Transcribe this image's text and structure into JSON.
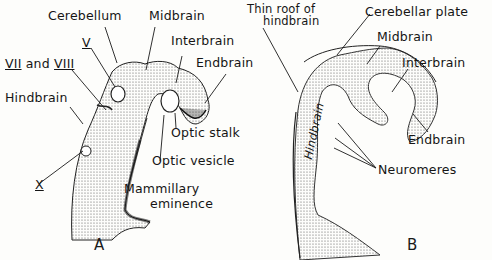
{
  "figure_a": {
    "panel_label": "A",
    "labels": {
      "cerebellum": "Cerebellum",
      "midbrain": "Midbrain",
      "interbrain": "Interbrain",
      "endbrain": "Endbrain",
      "nerve_v": "V",
      "nerve_vii": "VII",
      "and": "and",
      "nerve_viii": "VIII",
      "hindbrain": "Hindbrain",
      "optic_stalk": "Optic stalk",
      "optic_vesicle": "Optic vesicle",
      "mammillary_1": "Mammillary",
      "mammillary_2": "eminence",
      "nerve_x": "X"
    }
  },
  "figure_b": {
    "panel_label": "B",
    "labels": {
      "thin_roof_1": "Thin roof of",
      "thin_roof_2": "hindbrain",
      "cerebellar_plate": "Cerebellar plate",
      "midbrain": "Midbrain",
      "interbrain": "Interbrain",
      "endbrain": "Endbrain",
      "hindbrain_vertical": "Hindbrain",
      "neuromeres": "Neuromeres"
    }
  },
  "colors": {
    "ink": "#151515",
    "stipple": "#8a8a8a",
    "background": "#fdfdfb"
  }
}
